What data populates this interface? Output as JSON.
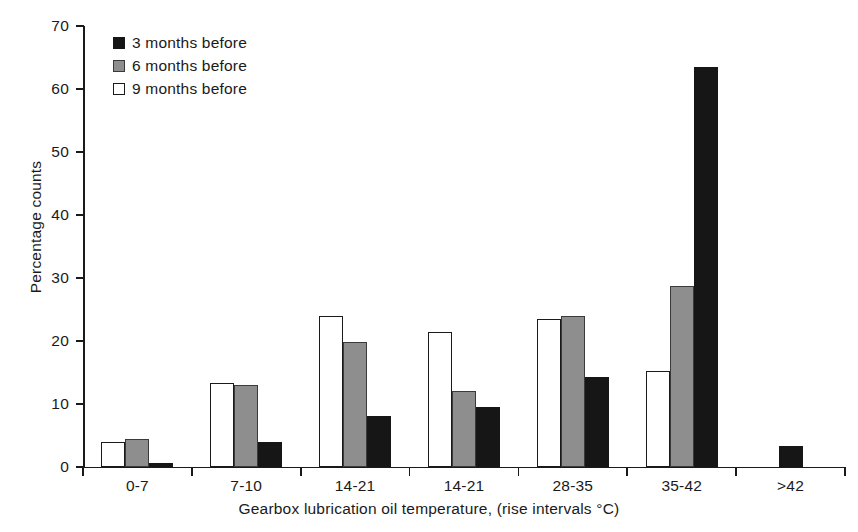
{
  "chart_data": {
    "type": "bar",
    "title": "",
    "xlabel": "Gearbox lubrication oil temperature, (rise intervals °C)",
    "ylabel": "Percentage counts",
    "categories": [
      "0-7",
      "7-10",
      "14-21",
      "14-21",
      "28-35",
      "35-42",
      ">42"
    ],
    "series": [
      {
        "name": "3 months before",
        "color": "#161616",
        "swatch": "sw-black",
        "style": "series-black",
        "values": [
          0.6,
          4.0,
          8.1,
          9.5,
          14.3,
          63.5,
          3.3
        ]
      },
      {
        "name": "6 months before",
        "color": "#8e8e8e",
        "swatch": "sw-gray",
        "style": "series-gray",
        "values": [
          4.5,
          13.0,
          19.9,
          12.1,
          24.0,
          28.8,
          0
        ]
      },
      {
        "name": "9 months before",
        "color": "#ffffff",
        "swatch": "sw-white",
        "style": "series-white",
        "values": [
          4.0,
          13.3,
          24.0,
          21.5,
          23.5,
          15.2,
          0
        ]
      }
    ],
    "series_draw_order": [
      "9 months before",
      "6 months before",
      "3 months before"
    ],
    "ylim": [
      0,
      70
    ],
    "yticks": [
      0,
      10,
      20,
      30,
      40,
      50,
      60,
      70
    ],
    "ytick_labels": [
      "0",
      "10",
      "20",
      "30",
      "40",
      "50",
      "60",
      "70"
    ],
    "grid": false,
    "legend_position": "top-left"
  },
  "legend": {
    "entries": [
      {
        "label": "3 months before",
        "swatch": "sw-black"
      },
      {
        "label": "6 months before",
        "swatch": "sw-gray"
      },
      {
        "label": "9 months before",
        "swatch": "sw-white"
      }
    ]
  }
}
